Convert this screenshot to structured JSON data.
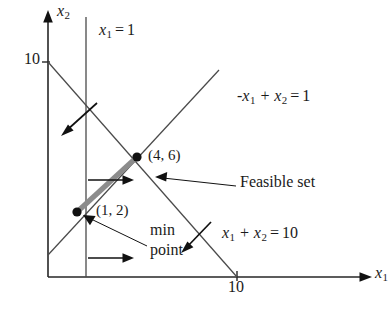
{
  "figure": {
    "background_color": "#ffffff",
    "line_color": "#4a4a4a",
    "axis_color": "#262626",
    "feasible_color": "#8c8c8c",
    "marker_color": "#111111"
  },
  "axes": {
    "y_axis_label": "x",
    "y_axis_sub": "2",
    "x_axis_label": "x",
    "x_axis_sub": "1",
    "y_tick_label": "10",
    "x_tick_label": "10",
    "x_origin_px": 48,
    "y_origin_px": 277,
    "px_per_unit_x": 18.9,
    "px_per_unit_y": 21.5
  },
  "constraints": [
    {
      "name": "vertical-constraint",
      "label_lhs": "x",
      "label_sub": "1",
      "label_rel": "=",
      "label_rhs": "1",
      "text": "x1 = 1",
      "normal_direction": "right"
    },
    {
      "name": "diagonal-up-constraint",
      "label_lhs": "-x",
      "label_sub": "1",
      "label_mid": "+ x",
      "label_sub2": "2",
      "label_rel": "=",
      "label_rhs": "1",
      "text": "-x1 + x2 = 1",
      "normal_direction": "down-left"
    },
    {
      "name": "diagonal-down-constraint",
      "label_lhs": "x",
      "label_sub": "1",
      "label_mid": "+ x",
      "label_sub2": "2",
      "label_rel": "=",
      "label_rhs": "10",
      "text": "x1 + x2 = 10",
      "normal_direction": "down-left"
    }
  ],
  "vertices": [
    {
      "name": "upper-vertex",
      "label": "(4, 6)",
      "x": 4,
      "y": 6,
      "px": 137,
      "py": 157
    },
    {
      "name": "min-vertex",
      "label": "(1, 2)",
      "x": 1,
      "y": 2,
      "px": 77,
      "py": 212
    }
  ],
  "annotations": {
    "feasible_set": "Feasible set",
    "min_point_line1": "min",
    "min_point_line2": "point"
  }
}
